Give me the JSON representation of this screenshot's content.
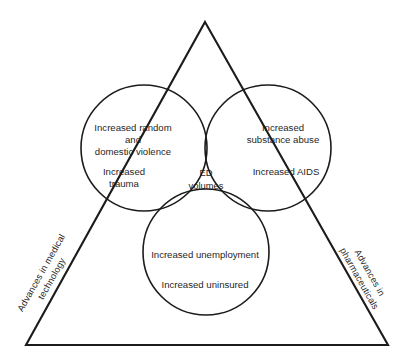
{
  "figure": {
    "colors": {
      "stroke": "#1c1c1c",
      "text": "#1f1f1f",
      "background": "#ffffff"
    }
  },
  "triangle": {
    "name": "outer-triangle",
    "edges": [
      {
        "id": "left",
        "label": "Advances in medical",
        "label_line2": "technology"
      },
      {
        "id": "right",
        "label": "Advances in",
        "label_line2": "pharmaceuticals"
      },
      {
        "id": "bottom",
        "label": ""
      }
    ]
  },
  "venn": {
    "circles": [
      {
        "id": "left-circle",
        "name": "violence-trauma-circle",
        "lines": [
          "Increased random",
          "and",
          "domestic violence",
          "Increased",
          "trauma"
        ]
      },
      {
        "id": "right-circle",
        "name": "substance-aids-circle",
        "lines": [
          "Increased",
          "substance abuse",
          "Increased AIDS"
        ]
      },
      {
        "id": "bottom-circle",
        "name": "unemployment-uninsured-circle",
        "lines": [
          "Increased unemployment",
          "Increased uninsured"
        ]
      }
    ],
    "center": {
      "name": "ed-volumes-intersection",
      "line1": "ED",
      "line2": "volumes"
    }
  }
}
